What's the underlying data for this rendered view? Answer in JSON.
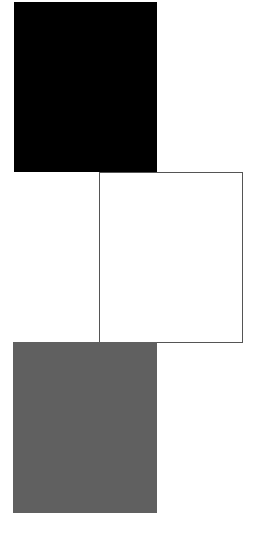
{
  "swatches": [
    {
      "id": "black",
      "color": "#000000"
    },
    {
      "id": "white",
      "color": "#ffffff",
      "border": "#555555"
    },
    {
      "id": "gray",
      "color": "#606060"
    }
  ]
}
